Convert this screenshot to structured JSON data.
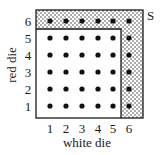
{
  "diagram": {
    "x_axis": {
      "label": "white die",
      "ticks": [
        "1",
        "2",
        "3",
        "4",
        "5",
        "6"
      ]
    },
    "y_axis": {
      "label": "red die",
      "ticks": [
        "1",
        "2",
        "3",
        "4",
        "5",
        "6"
      ]
    },
    "event_label": "S",
    "event_description": "Shaded region: outcomes where white die = 6 or red die = 6",
    "grid": {
      "rows": 6,
      "cols": 6,
      "shaded_row": 6,
      "shaded_col": 6
    },
    "colors": {
      "frame": "#1a1a1a",
      "dot": "#111111",
      "shade_dot": "#555555",
      "background": "#ffffff"
    }
  }
}
